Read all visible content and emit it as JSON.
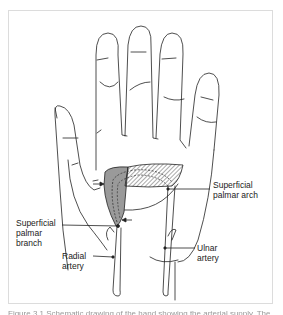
{
  "figure": {
    "labels": {
      "superficial_palmar_arch": "Superficial\npalmar arch",
      "superficial_palmar_branch": "Superficial\npalmar\nbranch",
      "radial_artery": "Radial\nartery",
      "ulnar_artery": "Ulnar\nartery"
    },
    "caption": "Figure 3.1 Schematic drawing of the hand showing the arterial supply. The",
    "colors": {
      "line": "#222222",
      "shaded_region": "#9a9a9a",
      "hatched_region": "#555555",
      "frame_border": "#dcdcdc",
      "background": "#ffffff"
    }
  }
}
